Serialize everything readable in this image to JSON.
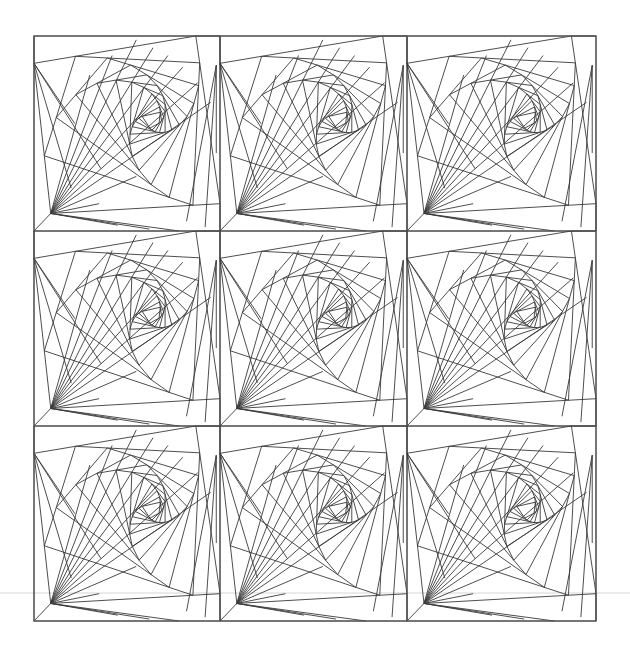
{
  "artwork": {
    "type": "geometric-line-pattern",
    "description": "3x3 grid of identical tiles, each a whirling spiral of nested quadrilaterals",
    "grid": {
      "rows": 3,
      "cols": 3
    },
    "frame": {
      "left": 34,
      "top": 36,
      "right": 596,
      "bottom": 621
    },
    "tile": {
      "width": 187.3,
      "height": 195
    },
    "column_edges": [
      34,
      220,
      407,
      596
    ],
    "row_edges": [
      36,
      231,
      426,
      621
    ],
    "spiral": {
      "initial_quad_relative": [
        [
          0.0,
          0.14
        ],
        [
          0.87,
          0.0
        ],
        [
          1.0,
          0.86
        ],
        [
          0.09,
          0.91
        ]
      ],
      "iterations": 11,
      "t": 0.16
    },
    "colors": {
      "background": "#ffffff",
      "line": "#3a3a3a",
      "frame": "#555555",
      "guide": "#d6d6d6"
    },
    "guide_line": {
      "y": 593,
      "x1": 0,
      "x2": 630
    }
  }
}
